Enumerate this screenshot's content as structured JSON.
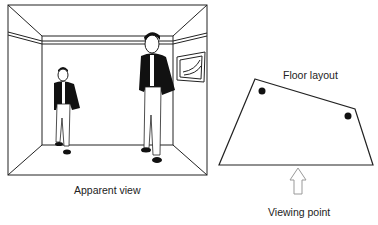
{
  "apparent_view": {
    "caption": "Apparent view",
    "figures": [
      {
        "name": "small-person",
        "position": "left, near back wall"
      },
      {
        "name": "large-person",
        "position": "right, near back wall"
      }
    ],
    "wall_picture": "framed picture on right wall"
  },
  "floor_layout": {
    "title": "Floor layout",
    "caption": "Viewing point",
    "markers": [
      {
        "name": "left-person-position"
      },
      {
        "name": "right-person-position"
      }
    ]
  },
  "colors": {
    "line": "#222222",
    "fill": "#000000",
    "arrow": "#999999",
    "background": "#ffffff"
  }
}
